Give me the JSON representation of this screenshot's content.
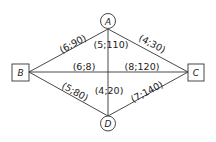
{
  "diagram": {
    "type": "network graph",
    "nodes": [
      {
        "id": "A",
        "label": "A",
        "shape": "circle"
      },
      {
        "id": "B",
        "label": "B",
        "shape": "square"
      },
      {
        "id": "C",
        "label": "C",
        "shape": "square"
      },
      {
        "id": "D",
        "label": "D",
        "shape": "circle"
      }
    ],
    "edges": [
      {
        "from": "B",
        "to": "A",
        "label": "(6;90)"
      },
      {
        "from": "A",
        "to": "C",
        "label": "(4;30)"
      },
      {
        "from": "A",
        "to": "D",
        "label": "(5;110)"
      },
      {
        "from": "B",
        "to": "C",
        "label_left": "(6;8)",
        "label_right": "(8;120)"
      },
      {
        "from": "B",
        "to": "D",
        "label": "(5;80)"
      },
      {
        "from": "D",
        "to": "C",
        "label": "(7;140)"
      },
      {
        "from": "D",
        "to": "A",
        "label": "(4;20)"
      }
    ]
  }
}
